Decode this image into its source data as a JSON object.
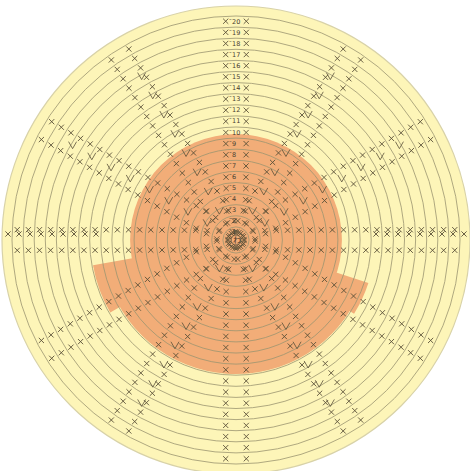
{
  "diagram": {
    "center": {
      "x": 236,
      "y": 240
    },
    "outer_radius": 234,
    "ring_count": 20,
    "ring_spacing": 11.1,
    "start_symbol": "わ",
    "colors": {
      "background": "#ffffff",
      "outer_fill": "#fdf5b8",
      "inner_fill": "#f2ad78",
      "ring_stroke": "#9a9470",
      "stitch_stroke": "#5a5038",
      "outer_border": "#d8d2a8"
    },
    "highlight": {
      "rounds": "1-9",
      "description": "Orange region covering inner rounds with extensions at lower-left and lower-right"
    },
    "row_labels": [
      {
        "round": 1,
        "label": "1"
      },
      {
        "round": 2,
        "label": "2"
      },
      {
        "round": 3,
        "label": "3"
      },
      {
        "round": 4,
        "label": "4"
      },
      {
        "round": 5,
        "label": "5"
      },
      {
        "round": 6,
        "label": "6"
      },
      {
        "round": 7,
        "label": "7"
      },
      {
        "round": 8,
        "label": "8"
      },
      {
        "round": 9,
        "label": "9"
      },
      {
        "round": 10,
        "label": "10"
      },
      {
        "round": 11,
        "label": "11"
      },
      {
        "round": 12,
        "label": "12"
      },
      {
        "round": 13,
        "label": "13"
      },
      {
        "round": 14,
        "label": "14"
      },
      {
        "round": 15,
        "label": "15"
      },
      {
        "round": 16,
        "label": "16"
      },
      {
        "round": 17,
        "label": "17"
      },
      {
        "round": 18,
        "label": "18"
      },
      {
        "round": 19,
        "label": "19"
      },
      {
        "round": 20,
        "label": "20"
      }
    ],
    "stitch_symbols": {
      "single_crochet": "×",
      "increase": "V",
      "chain_start": "slip"
    }
  }
}
